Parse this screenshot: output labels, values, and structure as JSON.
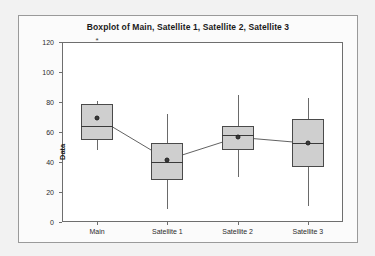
{
  "chart_data": {
    "type": "boxplot",
    "title": "Boxplot of Main, Satellite 1, Satellite 2, Satellite 3",
    "xlabel": "",
    "ylabel": "Data",
    "ylim": [
      0,
      120
    ],
    "yticks": [
      0,
      20,
      40,
      60,
      80,
      100,
      120
    ],
    "ytick_labels": [
      "0",
      "20",
      "40",
      "60",
      "80",
      "100",
      "120"
    ],
    "grid": false,
    "legend": "none",
    "categories": [
      "Main",
      "Satellite 1",
      "Satellite 2",
      "Satellite 3"
    ],
    "boxes": [
      {
        "category": "Main",
        "whisker_low": 48,
        "q1": 55,
        "median": 64,
        "q3": 79,
        "whisker_high": 81,
        "mean": 69.5,
        "outliers": [
          121
        ]
      },
      {
        "category": "Satellite 1",
        "whisker_low": 9,
        "q1": 28,
        "median": 40,
        "q3": 53,
        "whisker_high": 72,
        "mean": 41.5,
        "outliers": []
      },
      {
        "category": "Satellite 2",
        "whisker_low": 30,
        "q1": 48,
        "median": 58,
        "q3": 64,
        "whisker_high": 85,
        "mean": 56.5,
        "outliers": []
      },
      {
        "category": "Satellite 3",
        "whisker_low": 11,
        "q1": 37,
        "median": 53,
        "q3": 69,
        "whisker_high": 83,
        "mean": 52.5,
        "outliers": []
      }
    ],
    "mean_connect_line": true,
    "colors": {
      "box_fill": "#cfcfcf",
      "box_edge": "#4a4a4a",
      "median": "#3a3a3a",
      "whisker": "#6a6a6a",
      "mean_marker": "#3a3a3a",
      "axis": "#6e6e6e",
      "plot_background": "#ffffff",
      "figure_background": "#f2f2f2",
      "text": "#1a1a1a"
    }
  }
}
